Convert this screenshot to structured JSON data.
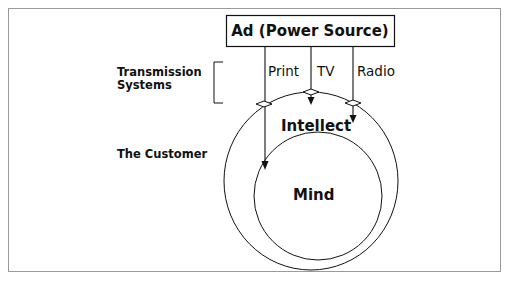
{
  "diagram": {
    "source_box": {
      "label": "Ad (Power Source)"
    },
    "left_labels": {
      "transmission": [
        "Transmission",
        "Systems"
      ],
      "customer": "The Customer"
    },
    "channels": [
      {
        "label": "Print"
      },
      {
        "label": "TV"
      },
      {
        "label": "Radio"
      }
    ],
    "outer_circle": {
      "label": "Intellect"
    },
    "inner_circle": {
      "label": "Mind"
    },
    "colors": {
      "stroke": "#111111",
      "frame": "#9a9a9a",
      "background": "#ffffff"
    }
  }
}
